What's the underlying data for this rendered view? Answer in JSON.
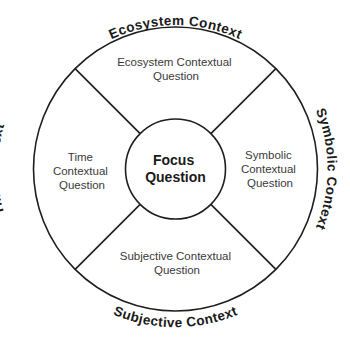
{
  "diagram": {
    "type": "concentric-context-wheel",
    "center": {
      "line1": "Focus",
      "line2": "Question"
    },
    "quadrants": {
      "top": {
        "lines": [
          "Ecosystem Contextual",
          "Question"
        ]
      },
      "right": {
        "lines": [
          "Symbolic",
          "Contextual",
          "Question"
        ]
      },
      "bottom": {
        "lines": [
          "Subjective Contextual",
          "Question"
        ]
      },
      "left": {
        "lines": [
          "Time",
          "Contextual",
          "Question"
        ]
      }
    },
    "contexts": {
      "top": "Ecosystem Context",
      "right": "Symbolic Context",
      "bottom": "Subjective Context",
      "left": "Time Context"
    },
    "colors": {
      "stroke": "#1e1e1e",
      "text": "#1a1a1a",
      "question_text": "#3a3a3a",
      "background": "#ffffff"
    }
  }
}
